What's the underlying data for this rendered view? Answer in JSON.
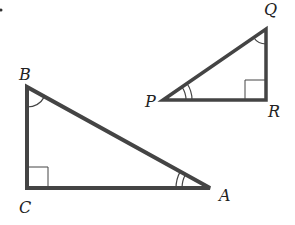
{
  "diagram": {
    "stroke_color": "#444444",
    "dot": {
      "x": 1,
      "y": 10
    },
    "triangle_abc": {
      "vertices": {
        "A": [
          210,
          188
        ],
        "B": [
          27,
          87
        ],
        "C": [
          27,
          188
        ]
      },
      "labels": {
        "A": {
          "text": "A",
          "x": 219,
          "y": 201
        },
        "B": {
          "text": "B",
          "x": 19,
          "y": 80
        },
        "C": {
          "text": "C",
          "x": 19,
          "y": 213
        }
      },
      "right_angle_at": "C",
      "single_arc_at": "B",
      "double_arc_at": "A"
    },
    "triangle_pqr": {
      "vertices": {
        "P": [
          163,
          100
        ],
        "Q": [
          266,
          29
        ],
        "R": [
          266,
          100
        ]
      },
      "labels": {
        "P": {
          "text": "P",
          "x": 145,
          "y": 107
        },
        "Q": {
          "text": "Q",
          "x": 264,
          "y": 15
        },
        "R": {
          "text": "R",
          "x": 268,
          "y": 117
        }
      },
      "right_angle_at": "R",
      "single_arc_at": "Q",
      "double_arc_at": "P"
    }
  }
}
